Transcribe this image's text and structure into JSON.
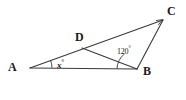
{
  "figure": {
    "type": "geometry-diagram",
    "background_color": "#ffffff",
    "stroke_color": "#3a3a3a",
    "text_color": "#1a1a1a"
  },
  "vertices": [
    {
      "id": "A",
      "label": "A",
      "x": 30,
      "y": 68,
      "label_x": 8,
      "label_y": 61
    },
    {
      "id": "D",
      "label": "D",
      "x": 82,
      "y": 48,
      "label_x": 75,
      "label_y": 31
    },
    {
      "id": "B",
      "label": "B",
      "x": 137,
      "y": 69,
      "label_x": 143,
      "label_y": 65
    },
    {
      "id": "C",
      "label": "C",
      "x": 163,
      "y": 20,
      "label_x": 167,
      "label_y": 5
    }
  ],
  "segments": [
    {
      "id": "AC",
      "from": "A",
      "to": "C",
      "note": "passes through D"
    },
    {
      "id": "AB",
      "from": "A",
      "to": "B"
    },
    {
      "id": "DB",
      "from": "D",
      "to": "B"
    },
    {
      "id": "BC",
      "from": "B",
      "to": "C"
    }
  ],
  "angles": [
    {
      "id": "angle-A",
      "at": "A",
      "label": "x",
      "degree_symbol": "°",
      "marker": "single-arc",
      "label_x": 57,
      "label_y": 59
    },
    {
      "id": "angle-DBC",
      "at": "B",
      "label": "120",
      "degree_symbol": "°",
      "marker": "single-arc",
      "label_x": 117,
      "label_y": 46
    }
  ]
}
